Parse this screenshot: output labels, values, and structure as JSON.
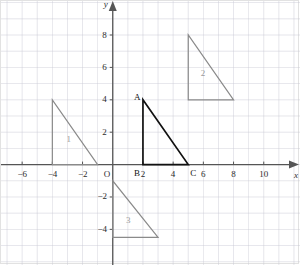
{
  "figure": {
    "kind": "coordinate-plane-with-triangles",
    "background_color": "#ffffff",
    "border_color": "#e2e2e2",
    "grid_color": "#c8c8d4",
    "axis_color": "#555555",
    "shape_stroke_color": "#8a8a8a",
    "main_shape_stroke_color": "#111111"
  },
  "axes": {
    "x": {
      "name": "x",
      "min": -7.4,
      "max": 12.4,
      "tick_step": 1,
      "label_step": 2,
      "labels": [
        {
          "value": -6,
          "text": "−6"
        },
        {
          "value": -4,
          "text": "−4"
        },
        {
          "value": -2,
          "text": "−2"
        },
        {
          "value": 2,
          "text": "2"
        },
        {
          "value": 4,
          "text": "4"
        },
        {
          "value": 6,
          "text": "6"
        },
        {
          "value": 8,
          "text": "8"
        },
        {
          "value": 10,
          "text": "10"
        }
      ]
    },
    "y": {
      "name": "y",
      "min": -6.2,
      "max": 10.1,
      "tick_step": 1,
      "label_step": 2,
      "labels": [
        {
          "value": 8,
          "text": "8"
        },
        {
          "value": 6,
          "text": "6"
        },
        {
          "value": 4,
          "text": "4"
        },
        {
          "value": 2,
          "text": "2"
        },
        {
          "value": -2,
          "text": "−2"
        },
        {
          "value": -4,
          "text": "−4"
        }
      ]
    },
    "origin_label": "O"
  },
  "chart_data": {
    "type": "scatter",
    "title": "",
    "xlabel": "x",
    "ylabel": "y",
    "xlim": [
      -7.4,
      12.4
    ],
    "ylim": [
      -6.2,
      10.1
    ],
    "grid": true,
    "legend": "none",
    "shapes": [
      {
        "name": "triangle-1",
        "label": "1",
        "label_point": {
          "x": -2.9,
          "y": 1.55
        },
        "style": "outline-gray",
        "points": [
          {
            "x": -4,
            "y": 4
          },
          {
            "x": -4,
            "y": 0
          },
          {
            "x": -1,
            "y": 0
          }
        ]
      },
      {
        "name": "triangle-2",
        "label": "2",
        "label_point": {
          "x": 6.0,
          "y": 5.6
        },
        "style": "outline-gray",
        "points": [
          {
            "x": 5,
            "y": 8
          },
          {
            "x": 5,
            "y": 4
          },
          {
            "x": 8,
            "y": 4
          }
        ]
      },
      {
        "name": "triangle-3",
        "label": "3",
        "label_point": {
          "x": 1.05,
          "y": -3.45
        },
        "style": "outline-gray",
        "points": [
          {
            "x": 0,
            "y": -1
          },
          {
            "x": 0,
            "y": -4.5
          },
          {
            "x": 3,
            "y": -4.5
          }
        ]
      },
      {
        "name": "triangle-abc",
        "label": "",
        "style": "outline-black",
        "points": [
          {
            "x": 2,
            "y": 4
          },
          {
            "x": 2,
            "y": 0
          },
          {
            "x": 5,
            "y": 0
          }
        ],
        "vertex_labels": [
          {
            "text": "A",
            "x": 2,
            "y": 4,
            "dx": -9,
            "dy": -2
          },
          {
            "text": "B",
            "x": 2,
            "y": 0,
            "dx": -9,
            "dy": 9
          },
          {
            "text": "C",
            "x": 5,
            "y": 0,
            "dx": 2,
            "dy": 9
          }
        ]
      }
    ]
  }
}
